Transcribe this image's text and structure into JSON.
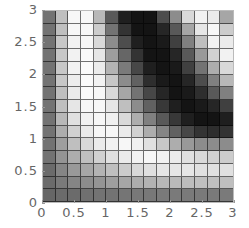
{
  "chart_data": {
    "type": "heatmap",
    "title": "",
    "xlabel": "",
    "ylabel": "",
    "xlim": [
      0,
      3
    ],
    "ylim": [
      0,
      3
    ],
    "grid": true,
    "colormap": "grayscale (black = low/high?, white = light)",
    "x_ticks": [
      "0",
      "0.5",
      "1",
      "1.5",
      "2",
      "2.5",
      "3"
    ],
    "y_ticks": [
      "0",
      "0.5",
      "1",
      "1.5",
      "2",
      "2.5",
      "3"
    ],
    "n_cols": 15,
    "n_rows": 15,
    "rows_top_to_bottom_gray": [
      [
        0.45,
        0.75,
        0.97,
        0.97,
        0.72,
        0.35,
        0.12,
        0.08,
        0.08,
        0.3,
        0.55,
        0.85,
        0.95,
        0.92,
        0.65
      ],
      [
        0.45,
        0.75,
        0.97,
        0.97,
        0.8,
        0.45,
        0.2,
        0.08,
        0.08,
        0.15,
        0.35,
        0.65,
        0.9,
        0.97,
        0.8
      ],
      [
        0.45,
        0.78,
        0.95,
        0.97,
        0.85,
        0.55,
        0.3,
        0.12,
        0.08,
        0.1,
        0.25,
        0.5,
        0.75,
        0.95,
        0.92
      ],
      [
        0.45,
        0.78,
        0.95,
        0.98,
        0.9,
        0.62,
        0.4,
        0.2,
        0.08,
        0.08,
        0.15,
        0.35,
        0.6,
        0.82,
        0.95
      ],
      [
        0.45,
        0.78,
        0.95,
        0.98,
        0.92,
        0.7,
        0.48,
        0.28,
        0.12,
        0.08,
        0.1,
        0.25,
        0.45,
        0.68,
        0.85
      ],
      [
        0.45,
        0.78,
        0.93,
        0.98,
        0.95,
        0.78,
        0.55,
        0.38,
        0.18,
        0.1,
        0.08,
        0.15,
        0.3,
        0.5,
        0.72
      ],
      [
        0.45,
        0.75,
        0.92,
        0.98,
        0.97,
        0.85,
        0.65,
        0.45,
        0.28,
        0.15,
        0.08,
        0.1,
        0.18,
        0.35,
        0.5
      ],
      [
        0.45,
        0.75,
        0.9,
        0.97,
        0.97,
        0.9,
        0.75,
        0.55,
        0.38,
        0.22,
        0.12,
        0.08,
        0.1,
        0.15,
        0.25
      ],
      [
        0.45,
        0.72,
        0.88,
        0.95,
        0.97,
        0.94,
        0.85,
        0.68,
        0.5,
        0.35,
        0.22,
        0.12,
        0.08,
        0.08,
        0.12
      ],
      [
        0.45,
        0.68,
        0.82,
        0.92,
        0.97,
        0.97,
        0.92,
        0.82,
        0.68,
        0.52,
        0.38,
        0.28,
        0.2,
        0.18,
        0.2
      ],
      [
        0.45,
        0.62,
        0.75,
        0.85,
        0.92,
        0.95,
        0.97,
        0.94,
        0.88,
        0.78,
        0.68,
        0.6,
        0.55,
        0.55,
        0.55
      ],
      [
        0.45,
        0.58,
        0.68,
        0.75,
        0.82,
        0.88,
        0.92,
        0.95,
        0.97,
        0.95,
        0.92,
        0.88,
        0.85,
        0.82,
        0.8
      ],
      [
        0.42,
        0.52,
        0.6,
        0.65,
        0.7,
        0.75,
        0.8,
        0.85,
        0.88,
        0.9,
        0.9,
        0.9,
        0.88,
        0.88,
        0.88
      ],
      [
        0.42,
        0.48,
        0.52,
        0.55,
        0.58,
        0.62,
        0.65,
        0.68,
        0.7,
        0.72,
        0.73,
        0.74,
        0.75,
        0.75,
        0.75
      ],
      [
        0.4,
        0.42,
        0.42,
        0.44,
        0.45,
        0.45,
        0.46,
        0.47,
        0.47,
        0.48,
        0.48,
        0.48,
        0.48,
        0.48,
        0.48
      ]
    ]
  },
  "axes": {
    "x_ticks": [
      {
        "label": "0",
        "pos": 0
      },
      {
        "label": "0.5",
        "pos": 0.5
      },
      {
        "label": "1",
        "pos": 1
      },
      {
        "label": "1.5",
        "pos": 1.5
      },
      {
        "label": "2",
        "pos": 2
      },
      {
        "label": "2.5",
        "pos": 2.5
      },
      {
        "label": "3",
        "pos": 3
      }
    ],
    "y_ticks": [
      {
        "label": "0",
        "pos": 0
      },
      {
        "label": "0.5",
        "pos": 0.5
      },
      {
        "label": "1",
        "pos": 1
      },
      {
        "label": "1.5",
        "pos": 1.5
      },
      {
        "label": "2",
        "pos": 2
      },
      {
        "label": "2.5",
        "pos": 2.5
      },
      {
        "label": "3",
        "pos": 3
      }
    ]
  }
}
